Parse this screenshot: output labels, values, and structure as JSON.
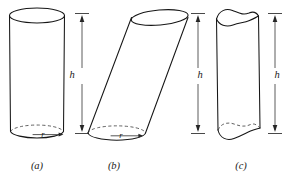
{
  "figure": {
    "background_color": "#ffffff",
    "line_color": "#161616",
    "hidden_line_color": "#3a3a3a",
    "dimension_color": "#333333",
    "panels": [
      {
        "id": "a",
        "caption": "(a)",
        "caption_x": 37,
        "caption_y": 167,
        "type": "right-circular-cylinder",
        "height_label": "h",
        "height_label_x": 72,
        "height_label_y": 76,
        "radius_label": "r",
        "radius_label_x": 43,
        "radius_label_y": 135
      },
      {
        "id": "b",
        "caption": "(b)",
        "caption_x": 114,
        "caption_y": 167,
        "type": "oblique-cylinder",
        "height_label": "h",
        "height_label_x": 200,
        "height_label_y": 76,
        "radius_label": "r",
        "radius_label_x": 121,
        "radius_label_y": 136
      },
      {
        "id": "c",
        "caption": "(c)",
        "caption_x": 241,
        "caption_y": 167,
        "type": "irregular-ended-cylinder",
        "height_label": "h",
        "height_label_x": 277,
        "height_label_y": 76,
        "radius_label": null,
        "radius_label_x": null,
        "radius_label_y": null
      }
    ]
  }
}
